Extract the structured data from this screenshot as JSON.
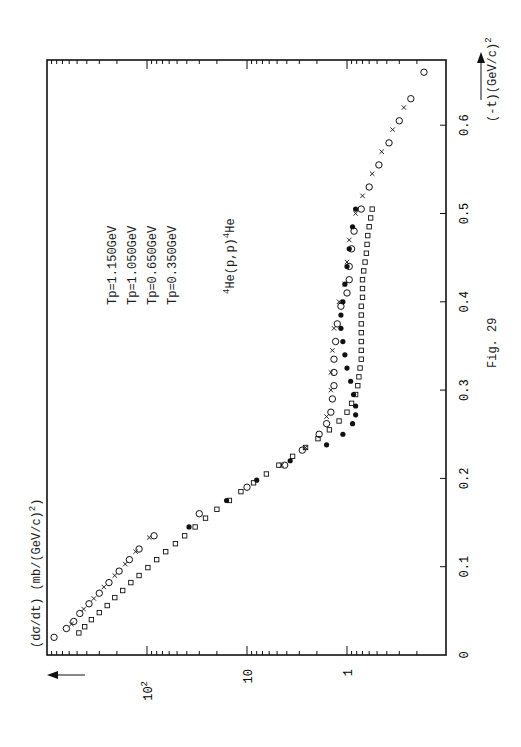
{
  "figure": {
    "caption": "Fig. 29",
    "reaction": "4He(p,p)4He",
    "reaction_parts": {
      "pre": "4",
      "a": "He(p,p)",
      "post": "4",
      "b": "He"
    },
    "legend": [
      {
        "label": "Tp=1.150GeV",
        "marker": "open-circle"
      },
      {
        "label": "Tp=1.050GeV",
        "marker": "cross"
      },
      {
        "label": "Tp=0.650GeV",
        "marker": "open-square"
      },
      {
        "label": "Tp=0.350GeV",
        "marker": "filled-circle"
      }
    ],
    "ylabel": "(dσ/dt) (mb/(GeV/c)²)",
    "ylabel_main": "(dσ/dt) (mb/(GeV/c)",
    "ylabel_sup": "2",
    "xlabel": "(-t)(GeV/c)²",
    "xlabel_main": "(-t)(GeV/c)",
    "xlabel_sup": "2",
    "orientation": "rotated 90° counter-clockwise"
  },
  "chart_data": {
    "type": "scatter",
    "title": "4He(p,p)4He",
    "xlabel": "(-t) (GeV/c)^2",
    "ylabel": "dσ/dt (mb/(GeV/c)^2)",
    "xlim": [
      0,
      0.68
    ],
    "ylim": [
      0.1,
      1000
    ],
    "yscale": "log",
    "grid": false,
    "legend_position": "upper-left (text only, no markers)",
    "x_ticks": [
      "0",
      "0.1",
      "0.2",
      "0.3",
      "0.4",
      "0.5",
      "0.6"
    ],
    "y_ticks": [
      "1",
      "10",
      "10^2"
    ],
    "series": [
      {
        "name": "Tp=1.150GeV",
        "marker": "open-circle",
        "x": [
          0.02,
          0.03,
          0.038,
          0.047,
          0.058,
          0.07,
          0.082,
          0.095,
          0.108,
          0.12,
          0.135,
          0.16,
          0.19,
          0.215,
          0.232,
          0.25,
          0.262,
          0.275,
          0.29,
          0.305,
          0.32,
          0.335,
          0.355,
          0.375,
          0.395,
          0.41,
          0.425,
          0.44,
          0.46,
          0.48,
          0.505,
          0.53,
          0.555,
          0.58,
          0.605,
          0.63,
          0.66
        ],
        "y": [
          850,
          640,
          540,
          470,
          380,
          300,
          240,
          190,
          150,
          120,
          85,
          30,
          10,
          4.2,
          2.8,
          1.9,
          1.6,
          1.45,
          1.4,
          1.35,
          1.35,
          1.35,
          1.3,
          1.25,
          1.15,
          1.0,
          0.95,
          0.95,
          0.9,
          0.85,
          0.72,
          0.6,
          0.48,
          0.38,
          0.3,
          0.23,
          0.17
        ]
      },
      {
        "name": "Tp=1.050GeV",
        "marker": "cross",
        "x": [
          0.035,
          0.052,
          0.064,
          0.077,
          0.09,
          0.103,
          0.117,
          0.133,
          0.215,
          0.235,
          0.27,
          0.3,
          0.32,
          0.345,
          0.37,
          0.4,
          0.42,
          0.445,
          0.47,
          0.5,
          0.52,
          0.545,
          0.57,
          0.595,
          0.62
        ],
        "y": [
          570,
          430,
          340,
          270,
          210,
          165,
          130,
          95,
          4.5,
          2.6,
          1.6,
          1.45,
          1.45,
          1.4,
          1.35,
          1.2,
          1.05,
          1.0,
          0.95,
          0.82,
          0.7,
          0.56,
          0.45,
          0.35,
          0.27
        ]
      },
      {
        "name": "Tp=0.650GeV",
        "marker": "open-square",
        "x": [
          0.025,
          0.032,
          0.04,
          0.048,
          0.056,
          0.065,
          0.073,
          0.082,
          0.09,
          0.099,
          0.108,
          0.117,
          0.126,
          0.135,
          0.145,
          0.155,
          0.165,
          0.175,
          0.185,
          0.195,
          0.205,
          0.215,
          0.225,
          0.235,
          0.245,
          0.255,
          0.265,
          0.275,
          0.285,
          0.295,
          0.305,
          0.315,
          0.325,
          0.335,
          0.345,
          0.355,
          0.365,
          0.375,
          0.385,
          0.395,
          0.405,
          0.415,
          0.425,
          0.435,
          0.445,
          0.455,
          0.465,
          0.475,
          0.485,
          0.495,
          0.505
        ],
        "y": [
          480,
          420,
          360,
          300,
          250,
          210,
          175,
          145,
          120,
          98,
          80,
          65,
          52,
          42,
          33,
          26,
          20,
          15,
          11.5,
          8.6,
          6.4,
          4.8,
          3.5,
          2.6,
          1.95,
          1.5,
          1.2,
          1.0,
          0.9,
          0.82,
          0.78,
          0.76,
          0.74,
          0.72,
          0.72,
          0.72,
          0.72,
          0.72,
          0.72,
          0.72,
          0.7,
          0.7,
          0.7,
          0.68,
          0.66,
          0.64,
          0.63,
          0.62,
          0.6,
          0.58,
          0.56
        ]
      },
      {
        "name": "Tp=0.350GeV",
        "marker": "filled-circle",
        "x": [
          0.145,
          0.175,
          0.198,
          0.22,
          0.238,
          0.25,
          0.262,
          0.272,
          0.282,
          0.295,
          0.31,
          0.325,
          0.34,
          0.355,
          0.37,
          0.385,
          0.4,
          0.42,
          0.44,
          0.46,
          0.485,
          0.505
        ],
        "y": [
          38,
          16,
          8.0,
          3.7,
          1.6,
          1.1,
          0.88,
          0.82,
          0.82,
          0.86,
          0.92,
          1.0,
          1.05,
          1.1,
          1.15,
          1.15,
          1.1,
          1.05,
          1.0,
          0.95,
          0.88,
          0.82
        ]
      }
    ]
  }
}
